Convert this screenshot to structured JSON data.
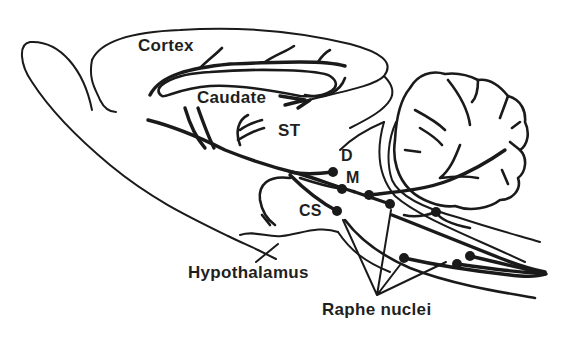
{
  "figure": {
    "stroke_color": "#1a1a1a",
    "background_color": "#ffffff"
  },
  "labels": {
    "cortex": "Cortex",
    "caudate": "Caudate",
    "st": "ST",
    "d": "D",
    "m": "M",
    "cs": "CS",
    "hypothalamus": "Hypothalamus",
    "raphe_nuclei": "Raphe nuclei"
  },
  "nuclei_dots": [
    {
      "id": "D",
      "x": 333,
      "y": 172
    },
    {
      "id": "M",
      "x": 342,
      "y": 189
    },
    {
      "id": "pons-1",
      "x": 369,
      "y": 195
    },
    {
      "id": "pons-2",
      "x": 390,
      "y": 204
    },
    {
      "id": "CS",
      "x": 337,
      "y": 211
    },
    {
      "id": "medulla-upper",
      "x": 436,
      "y": 212
    },
    {
      "id": "medulla-1",
      "x": 404,
      "y": 258
    },
    {
      "id": "medulla-2",
      "x": 457,
      "y": 264
    },
    {
      "id": "medulla-3",
      "x": 470,
      "y": 256
    }
  ],
  "raphe_pointer_origin": {
    "x": 377,
    "y": 295
  }
}
